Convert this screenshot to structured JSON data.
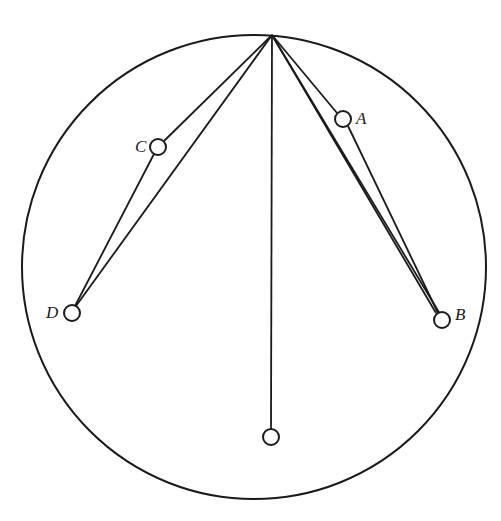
{
  "diagram": {
    "type": "pendulum-circle",
    "circle": {
      "cx": 254,
      "cy": 267,
      "r": 232
    },
    "apex": {
      "x": 272,
      "y": 35
    },
    "bobs": [
      {
        "id": "A",
        "label": "A",
        "x": 343,
        "y": 119,
        "r": 8,
        "label_x": 356,
        "label_y": 124,
        "string": "double"
      },
      {
        "id": "B",
        "label": "B",
        "x": 442,
        "y": 320,
        "r": 8,
        "label_x": 455,
        "label_y": 320,
        "string": "double"
      },
      {
        "id": "C",
        "label": "C",
        "x": 158,
        "y": 147,
        "r": 8,
        "label_x": 135,
        "label_y": 152,
        "string": "double"
      },
      {
        "id": "D",
        "label": "D",
        "x": 72,
        "y": 313,
        "r": 8,
        "label_x": 46,
        "label_y": 318,
        "string": "double"
      },
      {
        "id": "E",
        "label": "",
        "x": 271,
        "y": 437,
        "r": 8,
        "string": "single"
      }
    ],
    "strings": {
      "A_outer": {
        "x1": 272,
        "y1": 35,
        "x2": 436,
        "y2": 313
      },
      "A_inner": {
        "x1": 272,
        "y1": 35,
        "x2": 337,
        "y2": 113
      },
      "AB_link": {
        "x1": 348,
        "y1": 126,
        "x2": 438,
        "y2": 313
      },
      "B_direct": {
        "x1": 272,
        "y1": 35,
        "x2": 440,
        "y2": 314
      },
      "C_inner": {
        "x1": 272,
        "y1": 35,
        "x2": 164,
        "y2": 141
      },
      "CD_link": {
        "x1": 154,
        "y1": 154,
        "x2": 75,
        "y2": 306
      },
      "D_direct": {
        "x1": 272,
        "y1": 35,
        "x2": 76,
        "y2": 306
      },
      "vertical": {
        "x1": 272,
        "y1": 35,
        "x2": 271,
        "y2": 429
      }
    }
  }
}
